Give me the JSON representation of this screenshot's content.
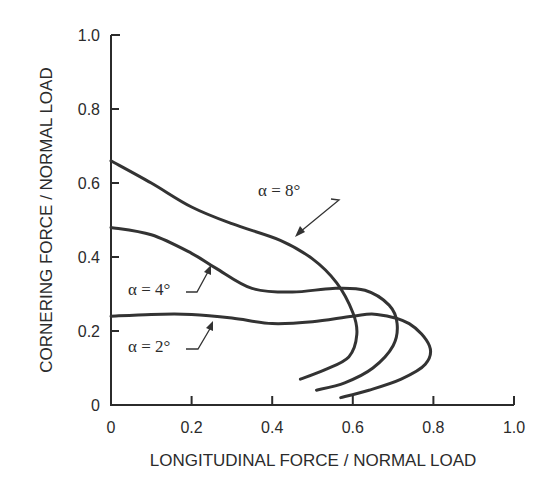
{
  "chart_data": {
    "type": "line",
    "title": "",
    "xlabel": "LONGITUDINAL FORCE / NORMAL LOAD",
    "ylabel": "CORNERING FORCE / NORMAL LOAD",
    "xlim": [
      0,
      1.0
    ],
    "ylim": [
      0,
      1.0
    ],
    "xticks": [
      "0",
      "0.2",
      "0.4",
      "0.6",
      "0.8",
      "1.0"
    ],
    "yticks": [
      "0",
      "0.2",
      "0.4",
      "0.6",
      "0.8",
      "1.0"
    ],
    "grid": false,
    "legend": "none (curves labeled by annotations with leader arrows)",
    "series": [
      {
        "name": "α = 8°",
        "label": "α=8°",
        "points": [
          [
            0,
            0.66
          ],
          [
            0.1,
            0.6
          ],
          [
            0.2,
            0.535
          ],
          [
            0.3,
            0.49
          ],
          [
            0.42,
            0.445
          ],
          [
            0.5,
            0.395
          ],
          [
            0.56,
            0.33
          ],
          [
            0.6,
            0.25
          ],
          [
            0.61,
            0.19
          ],
          [
            0.59,
            0.13
          ],
          [
            0.53,
            0.095
          ],
          [
            0.47,
            0.07
          ]
        ]
      },
      {
        "name": "α = 4°",
        "label": "α=4°",
        "points": [
          [
            0,
            0.48
          ],
          [
            0.1,
            0.46
          ],
          [
            0.2,
            0.41
          ],
          [
            0.26,
            0.37
          ],
          [
            0.35,
            0.315
          ],
          [
            0.45,
            0.305
          ],
          [
            0.55,
            0.315
          ],
          [
            0.63,
            0.31
          ],
          [
            0.69,
            0.27
          ],
          [
            0.71,
            0.22
          ],
          [
            0.7,
            0.16
          ],
          [
            0.65,
            0.1
          ],
          [
            0.58,
            0.06
          ],
          [
            0.51,
            0.04
          ]
        ]
      },
      {
        "name": "α = 2°",
        "label": "α=2°",
        "points": [
          [
            0,
            0.24
          ],
          [
            0.1,
            0.245
          ],
          [
            0.2,
            0.245
          ],
          [
            0.3,
            0.235
          ],
          [
            0.4,
            0.22
          ],
          [
            0.5,
            0.225
          ],
          [
            0.6,
            0.24
          ],
          [
            0.66,
            0.245
          ],
          [
            0.74,
            0.22
          ],
          [
            0.79,
            0.16
          ],
          [
            0.78,
            0.11
          ],
          [
            0.72,
            0.07
          ],
          [
            0.64,
            0.04
          ],
          [
            0.57,
            0.02
          ]
        ]
      }
    ],
    "annotations": [
      {
        "text": "α=8°",
        "points_to": [
          0.45,
          0.43
        ]
      },
      {
        "text": "α=4°",
        "points_to": [
          0.24,
          0.38
        ]
      },
      {
        "text": "α=2°",
        "points_to": [
          0.25,
          0.245
        ]
      }
    ]
  },
  "labels": {
    "xlabel": "LONGITUDINAL FORCE / NORMAL LOAD",
    "ylabel": "CORNERING FORCE / NORMAL LOAD",
    "ann8": "α = 8°",
    "ann4": "α = 4°",
    "ann2": "α = 2°"
  }
}
